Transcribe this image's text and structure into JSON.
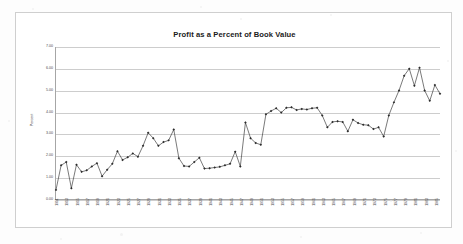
{
  "chart_data": {
    "type": "line",
    "title": "Profit as a Percent of Book Value",
    "xlabel": "",
    "ylabel": "Percent",
    "ylim": [
      0,
      7
    ],
    "ytick_labels": [
      "7.00",
      "6.00",
      "5.00",
      "4.00",
      "3.00",
      "2.00",
      "1.00",
      "0.00"
    ],
    "ytick_values": [
      7,
      6,
      5,
      4,
      3,
      2,
      1,
      0
    ],
    "grid": true,
    "legend": "none",
    "xtick_labels": [
      "1911",
      "1913",
      "1915",
      "1917",
      "1919",
      "1921",
      "1923",
      "1925",
      "1927",
      "1929",
      "1931",
      "1933",
      "1935",
      "1937",
      "1939",
      "1941",
      "1943",
      "1945",
      "1947",
      "1949",
      "1951",
      "1953",
      "1955",
      "1957",
      "1959",
      "1961",
      "1963",
      "1965",
      "1967",
      "1969",
      "1971",
      "1973",
      "1975",
      "1977",
      "1979",
      "1981",
      "1983",
      "1985"
    ],
    "x": [
      1911,
      1912,
      1913,
      1914,
      1915,
      1916,
      1917,
      1918,
      1919,
      1920,
      1921,
      1922,
      1923,
      1924,
      1925,
      1926,
      1927,
      1928,
      1929,
      1930,
      1931,
      1932,
      1933,
      1934,
      1935,
      1936,
      1937,
      1938,
      1939,
      1940,
      1941,
      1942,
      1943,
      1944,
      1945,
      1946,
      1947,
      1948,
      1949,
      1950,
      1951,
      1952,
      1953,
      1954,
      1955,
      1956,
      1957,
      1958,
      1959,
      1960,
      1961,
      1962,
      1963,
      1964,
      1965,
      1966,
      1967,
      1968,
      1969,
      1970,
      1971,
      1972,
      1973,
      1974,
      1975,
      1976,
      1977,
      1978,
      1979,
      1980,
      1981,
      1982,
      1983,
      1984,
      1985,
      1986
    ],
    "values": [
      0.42,
      1.55,
      1.7,
      0.5,
      1.58,
      1.25,
      1.32,
      1.5,
      1.65,
      1.05,
      1.35,
      1.62,
      2.2,
      1.8,
      1.92,
      2.1,
      1.95,
      2.45,
      3.05,
      2.8,
      2.45,
      2.62,
      2.7,
      3.2,
      1.88,
      1.52,
      1.5,
      1.7,
      1.9,
      1.4,
      1.42,
      1.45,
      1.48,
      1.55,
      1.62,
      2.18,
      1.5,
      3.52,
      2.8,
      2.58,
      2.5,
      3.9,
      4.05,
      4.18,
      3.98,
      4.2,
      4.22,
      4.1,
      4.15,
      4.12,
      4.18,
      4.2,
      3.85,
      3.3,
      3.55,
      3.58,
      3.55,
      3.12,
      3.65,
      3.5,
      3.42,
      3.4,
      3.22,
      3.3,
      2.88,
      3.85,
      4.45,
      5.0,
      5.68,
      6.0,
      5.22,
      6.05,
      5.0,
      4.52,
      5.25,
      4.85
    ],
    "series_color": "#3f3f3f",
    "marker": "diamond"
  }
}
